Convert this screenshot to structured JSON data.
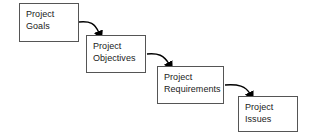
{
  "diagram": {
    "type": "flowchart",
    "background_color": "#ffffff",
    "box_border_color": "#555555",
    "box_fill_color": "#ffffff",
    "text_color": "#1a1a1a",
    "arrow_color": "#000000",
    "nodes": [
      {
        "id": "project-goals",
        "label": "Project\nGoals",
        "line1": "Project",
        "line2": "Goals",
        "x": 19,
        "y": 3,
        "width": 60,
        "height": 39
      },
      {
        "id": "project-objectives",
        "label": "Project\nObjectives",
        "line1": "Project",
        "line2": "Objectives",
        "x": 86,
        "y": 35,
        "width": 60,
        "height": 38
      },
      {
        "id": "project-requirements",
        "label": "Project\nRequirements",
        "line1": "Project",
        "line2": "Requirements",
        "x": 157,
        "y": 66,
        "width": 67,
        "height": 38
      },
      {
        "id": "project-issues",
        "label": "Project\nIssues",
        "line1": "Project",
        "line2": "Issues",
        "x": 238,
        "y": 96,
        "width": 60,
        "height": 36
      }
    ],
    "edges": [
      {
        "id": "goals-to-objectives",
        "from": "project-goals",
        "to": "project-objectives",
        "style": "curved-arrow",
        "path": "M 79 22 C 90 21, 95 23, 99 33",
        "arrowhead": "filled-triangle-down"
      },
      {
        "id": "objectives-to-requirements",
        "from": "project-objectives",
        "to": "project-requirements",
        "style": "curved-arrow",
        "path": "M 147 54 C 158 53, 164 55, 169 64",
        "arrowhead": "filled-triangle-down"
      },
      {
        "id": "requirements-to-issues",
        "from": "project-requirements",
        "to": "project-issues",
        "style": "curved-arrow",
        "path": "M 225 85 C 238 84, 246 86, 250 94",
        "arrowhead": "filled-triangle-down"
      }
    ]
  }
}
